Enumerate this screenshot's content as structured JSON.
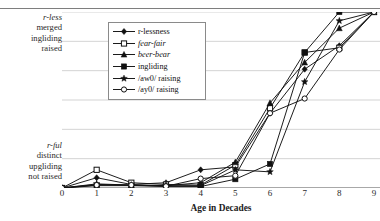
{
  "figure": {
    "ghost_header": "",
    "y_axis_top_label": [
      "r-less",
      "merged",
      "ingliding",
      "raised"
    ],
    "y_axis_bottom_label": [
      "r-ful",
      "distinct",
      "upgliding",
      "not raised"
    ],
    "x_axis_title": "Age in Decades"
  },
  "chart_data": {
    "type": "line",
    "title": "",
    "subtitle": "",
    "xlabel": "Age in Decades",
    "ylabel": "",
    "ylabel_top": "r-less merged ingliding raised",
    "ylabel_bottom": "r-ful distinct upgliding not raised",
    "x": [
      0,
      1,
      2,
      3,
      4,
      5,
      6,
      7,
      8,
      9
    ],
    "xlim": [
      0,
      9
    ],
    "ylim": [
      0,
      6
    ],
    "grid": "horizontal",
    "gridlines_y": [
      0,
      1,
      2,
      3,
      4,
      5,
      6
    ],
    "legend_position": "upper-left-inside",
    "xtick_labels": [
      "0",
      "1",
      "2",
      "3",
      "4",
      "5",
      "6",
      "7",
      "8",
      "9"
    ],
    "categories": [
      "0",
      "1",
      "2",
      "3",
      "4",
      "5",
      "6",
      "7",
      "8",
      "9"
    ],
    "series": [
      {
        "name": "r-lessness",
        "marker": "filled-diamond",
        "color": "#111111",
        "values": [
          0.0,
          0.35,
          0.12,
          0.18,
          0.62,
          0.72,
          2.55,
          4.05,
          4.85,
          6.0
        ]
      },
      {
        "name": "fear-fair",
        "marker": "open-square",
        "color": "#111111",
        "italic": true,
        "values": [
          0.0,
          0.62,
          0.18,
          0.12,
          0.1,
          0.78,
          2.72,
          4.62,
          4.78,
          6.0
        ]
      },
      {
        "name": "beer-bear",
        "marker": "filled-triangle",
        "color": "#111111",
        "italic": true,
        "values": [
          0.0,
          0.12,
          0.1,
          0.08,
          0.18,
          0.88,
          2.9,
          4.28,
          5.45,
          6.0
        ]
      },
      {
        "name": "ingliding",
        "marker": "filled-square",
        "color": "#111111",
        "values": [
          0.0,
          0.08,
          0.08,
          0.05,
          0.05,
          0.3,
          0.82,
          4.62,
          6.0,
          6.0
        ]
      },
      {
        "name": "/aw0/ raising",
        "marker": "filled-star",
        "color": "#111111",
        "values": [
          0.0,
          0.14,
          0.1,
          0.08,
          0.08,
          0.62,
          0.55,
          3.62,
          5.7,
          6.0
        ]
      },
      {
        "name": "/ay0/ raising",
        "marker": "open-circle",
        "color": "#111111",
        "values": [
          0.0,
          0.1,
          0.1,
          0.06,
          0.32,
          0.42,
          2.55,
          3.05,
          4.72,
          6.0
        ]
      }
    ]
  }
}
